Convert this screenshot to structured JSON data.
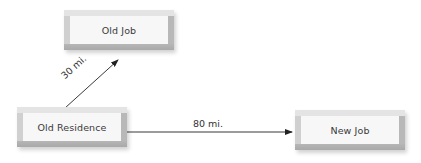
{
  "diagram": {
    "nodes": [
      {
        "id": "old_job",
        "label": "Old Job",
        "x": 64,
        "y": 10,
        "w": 110,
        "h": 40
      },
      {
        "id": "old_residence",
        "label": "Old Residence",
        "x": 17,
        "y": 107,
        "w": 110,
        "h": 40
      },
      {
        "id": "new_job",
        "label": "New Job",
        "x": 295,
        "y": 110,
        "w": 110,
        "h": 40
      }
    ],
    "edges": [
      {
        "from": "old_residence",
        "to": "old_job",
        "label": "30 mi."
      },
      {
        "from": "old_residence",
        "to": "new_job",
        "label": "80 mi."
      }
    ],
    "colors": {
      "line": "#222222",
      "box_face": "#f7f7f7",
      "box_bevel": "#c4c4c4",
      "text": "#3a3a3a"
    }
  }
}
